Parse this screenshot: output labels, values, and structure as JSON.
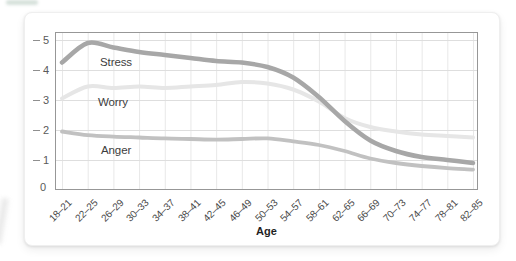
{
  "page": {
    "background": "#ffffff"
  },
  "card": {
    "background": "#ffffff",
    "border_color": "#efefef"
  },
  "chart_data": {
    "type": "line",
    "title": "",
    "xlabel": "Age",
    "ylabel": "",
    "ylim": [
      0,
      5.27
    ],
    "yticks": [
      0,
      1,
      2,
      3,
      4,
      5
    ],
    "grid": true,
    "legend_position": "inline-labels",
    "categories": [
      "18–21",
      "22–25",
      "26–29",
      "30–33",
      "34–37",
      "38–41",
      "42–45",
      "46–49",
      "50–53",
      "54–57",
      "58–61",
      "62–65",
      "66–69",
      "70–73",
      "74–77",
      "78–81",
      "82–85"
    ],
    "series": [
      {
        "name": "Worry",
        "color": "#e6e6e6",
        "stroke_width": 4,
        "label_xy": [
          98,
          96
        ],
        "values": [
          3.05,
          3.45,
          3.4,
          3.45,
          3.4,
          3.45,
          3.5,
          3.6,
          3.55,
          3.35,
          2.95,
          2.4,
          2.1,
          1.95,
          1.85,
          1.8,
          1.75
        ]
      },
      {
        "name": "Anger",
        "color": "#c1c1c1",
        "stroke_width": 3.8,
        "label_xy": [
          101,
          144
        ],
        "values": [
          1.95,
          1.83,
          1.78,
          1.75,
          1.72,
          1.7,
          1.68,
          1.7,
          1.72,
          1.62,
          1.5,
          1.3,
          1.05,
          0.9,
          0.8,
          0.73,
          0.68
        ]
      },
      {
        "name": "Stress",
        "color": "#a7a7a7",
        "stroke_width": 4.5,
        "label_xy": [
          100,
          56
        ],
        "values": [
          4.25,
          4.9,
          4.75,
          4.6,
          4.5,
          4.4,
          4.3,
          4.25,
          4.1,
          3.75,
          3.1,
          2.3,
          1.65,
          1.3,
          1.1,
          1.0,
          0.9
        ]
      }
    ],
    "axis": {
      "border_color": "#979797",
      "h_grid_color": "#dedede",
      "v_grid_color": "#e8e8e8",
      "y_tick_color": "#5a5a5a",
      "x_tick_color": "#4a4a4a"
    }
  }
}
